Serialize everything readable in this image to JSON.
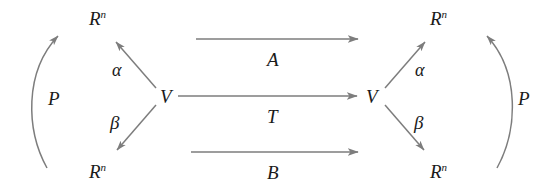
{
  "figure": {
    "kind": "commutative-diagram",
    "background_color": "#ffffff",
    "stroke_color": "#7d7d7d",
    "text_color": "#1a1a1a"
  },
  "objects": {
    "left_top_rn": "R",
    "left_top_rn_sup": "n",
    "left_bottom_rn": "R",
    "left_bottom_rn_sup": "n",
    "left_v": "V",
    "right_top_rn": "R",
    "right_top_rn_sup": "n",
    "right_bottom_rn": "R",
    "right_bottom_rn_sup": "n",
    "right_v": "V"
  },
  "morphisms": {
    "top_horizontal": "A",
    "middle_horizontal": "T",
    "bottom_horizontal": "B",
    "left_alpha": "α",
    "left_beta": "β",
    "right_alpha": "α",
    "right_beta": "β",
    "left_p": "P",
    "right_p": "P"
  }
}
